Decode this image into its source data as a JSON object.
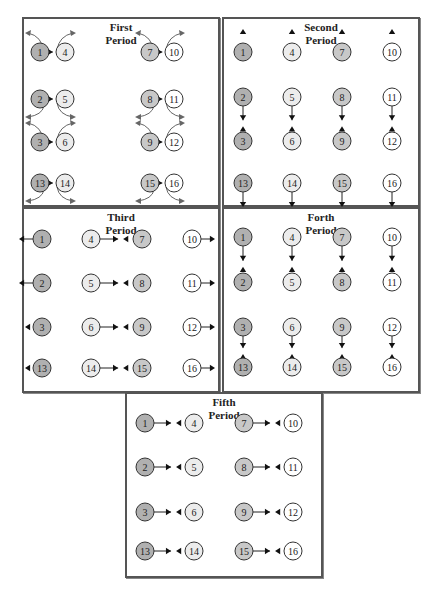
{
  "fills": {
    "colA": "#b0b0b0",
    "colB": "#ececec",
    "colC": "#c8c8c8",
    "colD": "#ffffff"
  },
  "node_groups": {
    "colA": [
      "1",
      "2",
      "3",
      "13"
    ],
    "colB": [
      "4",
      "5",
      "6",
      "14"
    ],
    "colC": [
      "7",
      "8",
      "9",
      "15"
    ],
    "colD": [
      "10",
      "11",
      "12",
      "16"
    ]
  },
  "panels": [
    {
      "id": "first",
      "title_line1": "First",
      "title_line2": "Period",
      "box": {
        "x": 22,
        "y": 17,
        "w": 198,
        "h": 190
      },
      "nodes": [
        {
          "n": "1",
          "x": 40,
          "y": 52
        },
        {
          "n": "4",
          "x": 65,
          "y": 52
        },
        {
          "n": "7",
          "x": 150,
          "y": 52
        },
        {
          "n": "10",
          "x": 174,
          "y": 52
        },
        {
          "n": "2",
          "x": 40,
          "y": 99
        },
        {
          "n": "5",
          "x": 65,
          "y": 99
        },
        {
          "n": "8",
          "x": 150,
          "y": 99
        },
        {
          "n": "11",
          "x": 174,
          "y": 99
        },
        {
          "n": "3",
          "x": 40,
          "y": 142
        },
        {
          "n": "6",
          "x": 65,
          "y": 142
        },
        {
          "n": "9",
          "x": 150,
          "y": 142
        },
        {
          "n": "12",
          "x": 174,
          "y": 142
        },
        {
          "n": "13",
          "x": 40,
          "y": 183
        },
        {
          "n": "14",
          "x": 65,
          "y": 183
        },
        {
          "n": "15",
          "x": 150,
          "y": 183
        },
        {
          "n": "16",
          "x": 174,
          "y": 183
        }
      ],
      "exchange_pairs": [
        [
          "1",
          "4"
        ],
        [
          "7",
          "10"
        ],
        [
          "2",
          "5"
        ],
        [
          "8",
          "11"
        ],
        [
          "3",
          "6"
        ],
        [
          "9",
          "12"
        ],
        [
          "13",
          "14"
        ],
        [
          "15",
          "16"
        ]
      ],
      "curls": [
        {
          "pair": [
            "1",
            "4"
          ],
          "dir": "up"
        },
        {
          "pair": [
            "7",
            "10"
          ],
          "dir": "up"
        },
        {
          "pair": [
            "2",
            "5"
          ],
          "dir": "down"
        },
        {
          "pair": [
            "8",
            "11"
          ],
          "dir": "down"
        },
        {
          "pair": [
            "3",
            "6"
          ],
          "dir": "up"
        },
        {
          "pair": [
            "9",
            "12"
          ],
          "dir": "up"
        },
        {
          "pair": [
            "13",
            "14"
          ],
          "dir": "down"
        },
        {
          "pair": [
            "15",
            "16"
          ],
          "dir": "down"
        }
      ]
    },
    {
      "id": "second",
      "title_line1": "Second",
      "title_line2": "Period",
      "box": {
        "x": 222,
        "y": 17,
        "w": 198,
        "h": 190
      },
      "nodes": [
        {
          "n": "1",
          "x": 243,
          "y": 52
        },
        {
          "n": "4",
          "x": 292,
          "y": 52
        },
        {
          "n": "7",
          "x": 342,
          "y": 52
        },
        {
          "n": "10",
          "x": 392,
          "y": 52
        },
        {
          "n": "2",
          "x": 243,
          "y": 97
        },
        {
          "n": "5",
          "x": 292,
          "y": 97
        },
        {
          "n": "8",
          "x": 342,
          "y": 97
        },
        {
          "n": "11",
          "x": 392,
          "y": 97
        },
        {
          "n": "3",
          "x": 243,
          "y": 141
        },
        {
          "n": "6",
          "x": 292,
          "y": 141
        },
        {
          "n": "9",
          "x": 342,
          "y": 141
        },
        {
          "n": "12",
          "x": 392,
          "y": 141
        },
        {
          "n": "13",
          "x": 243,
          "y": 183
        },
        {
          "n": "14",
          "x": 292,
          "y": 183
        },
        {
          "n": "15",
          "x": 342,
          "y": 183
        },
        {
          "n": "16",
          "x": 392,
          "y": 183
        }
      ],
      "exchange_pairs": [
        [
          "2",
          "3"
        ],
        [
          "5",
          "6"
        ],
        [
          "8",
          "9"
        ],
        [
          "11",
          "12"
        ]
      ],
      "incoming_heads": [
        {
          "x": 243,
          "y": 32,
          "dir": "up"
        },
        {
          "x": 292,
          "y": 32,
          "dir": "up"
        },
        {
          "x": 342,
          "y": 32,
          "dir": "up"
        },
        {
          "x": 392,
          "y": 32,
          "dir": "up"
        }
      ],
      "outgoing_lines": [
        {
          "from": "13",
          "dir": "down"
        },
        {
          "from": "14",
          "dir": "down"
        },
        {
          "from": "15",
          "dir": "down"
        },
        {
          "from": "16",
          "dir": "down"
        }
      ]
    },
    {
      "id": "third",
      "title_line1": "Third",
      "title_line2": "Period",
      "box": {
        "x": 22,
        "y": 207,
        "w": 198,
        "h": 186
      },
      "nodes": [
        {
          "n": "1",
          "x": 42,
          "y": 239
        },
        {
          "n": "4",
          "x": 91,
          "y": 239
        },
        {
          "n": "7",
          "x": 142,
          "y": 239
        },
        {
          "n": "10",
          "x": 192,
          "y": 239
        },
        {
          "n": "2",
          "x": 42,
          "y": 283
        },
        {
          "n": "5",
          "x": 91,
          "y": 283
        },
        {
          "n": "8",
          "x": 142,
          "y": 283
        },
        {
          "n": "11",
          "x": 192,
          "y": 283
        },
        {
          "n": "3",
          "x": 42,
          "y": 327
        },
        {
          "n": "6",
          "x": 91,
          "y": 327
        },
        {
          "n": "9",
          "x": 142,
          "y": 327
        },
        {
          "n": "12",
          "x": 192,
          "y": 327
        },
        {
          "n": "13",
          "x": 42,
          "y": 368
        },
        {
          "n": "14",
          "x": 91,
          "y": 368
        },
        {
          "n": "15",
          "x": 142,
          "y": 368
        },
        {
          "n": "16",
          "x": 192,
          "y": 368
        }
      ],
      "exchange_pairs": [
        [
          "4",
          "7"
        ],
        [
          "5",
          "8"
        ],
        [
          "6",
          "9"
        ],
        [
          "14",
          "15"
        ]
      ],
      "outgoing_lines": [
        {
          "from": "1",
          "dir": "left"
        },
        {
          "from": "2",
          "dir": "left"
        },
        {
          "from": "10",
          "dir": "right"
        },
        {
          "from": "11",
          "dir": "right"
        },
        {
          "from": "12",
          "dir": "right"
        },
        {
          "from": "16",
          "dir": "right"
        }
      ],
      "incoming_heads": [
        {
          "x": 27,
          "y": 327,
          "dir": "left-in"
        },
        {
          "x": 27,
          "y": 368,
          "dir": "left-in"
        }
      ]
    },
    {
      "id": "forth",
      "title_line1": "Forth",
      "title_line2": "Period",
      "box": {
        "x": 222,
        "y": 207,
        "w": 198,
        "h": 186
      },
      "nodes": [
        {
          "n": "1",
          "x": 243,
          "y": 237
        },
        {
          "n": "4",
          "x": 292,
          "y": 237
        },
        {
          "n": "7",
          "x": 342,
          "y": 237
        },
        {
          "n": "10",
          "x": 392,
          "y": 237
        },
        {
          "n": "2",
          "x": 243,
          "y": 282
        },
        {
          "n": "5",
          "x": 292,
          "y": 282
        },
        {
          "n": "8",
          "x": 342,
          "y": 282
        },
        {
          "n": "11",
          "x": 392,
          "y": 282
        },
        {
          "n": "3",
          "x": 243,
          "y": 327
        },
        {
          "n": "6",
          "x": 292,
          "y": 327
        },
        {
          "n": "9",
          "x": 342,
          "y": 327
        },
        {
          "n": "12",
          "x": 392,
          "y": 327
        },
        {
          "n": "13",
          "x": 243,
          "y": 367
        },
        {
          "n": "14",
          "x": 292,
          "y": 367
        },
        {
          "n": "15",
          "x": 342,
          "y": 367
        },
        {
          "n": "16",
          "x": 392,
          "y": 367
        }
      ],
      "exchange_pairs": [
        [
          "1",
          "2"
        ],
        [
          "4",
          "5"
        ],
        [
          "7",
          "8"
        ],
        [
          "10",
          "11"
        ],
        [
          "3",
          "13"
        ],
        [
          "6",
          "14"
        ],
        [
          "9",
          "15"
        ],
        [
          "12",
          "16"
        ]
      ]
    },
    {
      "id": "fifth",
      "title_line1": "Fifth",
      "title_line2": "Period",
      "box": {
        "x": 125,
        "y": 392,
        "w": 198,
        "h": 186
      },
      "nodes": [
        {
          "n": "1",
          "x": 145,
          "y": 423
        },
        {
          "n": "4",
          "x": 194,
          "y": 423
        },
        {
          "n": "7",
          "x": 244,
          "y": 423
        },
        {
          "n": "10",
          "x": 293,
          "y": 423
        },
        {
          "n": "2",
          "x": 145,
          "y": 467
        },
        {
          "n": "5",
          "x": 194,
          "y": 467
        },
        {
          "n": "8",
          "x": 244,
          "y": 467
        },
        {
          "n": "11",
          "x": 293,
          "y": 467
        },
        {
          "n": "3",
          "x": 145,
          "y": 512
        },
        {
          "n": "6",
          "x": 194,
          "y": 512
        },
        {
          "n": "9",
          "x": 244,
          "y": 512
        },
        {
          "n": "12",
          "x": 293,
          "y": 512
        },
        {
          "n": "13",
          "x": 145,
          "y": 551
        },
        {
          "n": "14",
          "x": 194,
          "y": 551
        },
        {
          "n": "15",
          "x": 244,
          "y": 551
        },
        {
          "n": "16",
          "x": 293,
          "y": 551
        }
      ],
      "exchange_pairs": [
        [
          "1",
          "4"
        ],
        [
          "7",
          "10"
        ],
        [
          "2",
          "5"
        ],
        [
          "8",
          "11"
        ],
        [
          "3",
          "6"
        ],
        [
          "9",
          "12"
        ],
        [
          "13",
          "14"
        ],
        [
          "15",
          "16"
        ]
      ]
    }
  ]
}
